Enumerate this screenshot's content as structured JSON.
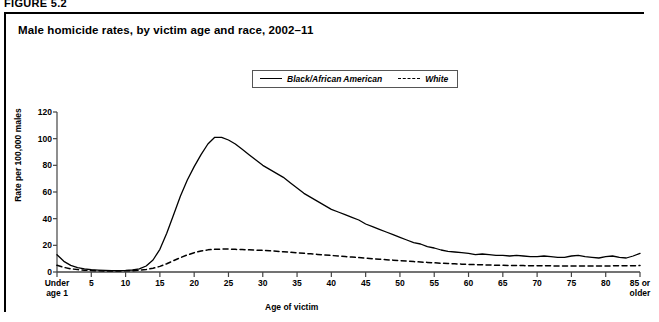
{
  "figure": {
    "label": "FIGURE 5.2",
    "title": "Male homicide rates, by victim age and race, 2002–11"
  },
  "legend": {
    "position": "top-center",
    "entries": [
      {
        "label": "Black/African American",
        "style": "solid",
        "color": "#000000"
      },
      {
        "label": "White",
        "style": "dashed",
        "color": "#000000"
      }
    ]
  },
  "axes": {
    "ylabel": "Rate per 100,000 males",
    "xlabel": "Age of victim",
    "yticks": [
      "0",
      "20",
      "40",
      "60",
      "80",
      "100",
      "120"
    ],
    "xticks": [
      "Under\nage 1",
      "5",
      "10",
      "15",
      "20",
      "25",
      "30",
      "35",
      "40",
      "45",
      "50",
      "55",
      "60",
      "65",
      "70",
      "75",
      "80",
      "85 or\nolder"
    ]
  },
  "chart_data": {
    "type": "line",
    "title": "Male homicide rates, by victim age and race, 2002–11",
    "xlabel": "Age of victim",
    "ylabel": "Rate per 100,000 males",
    "xlim": [
      0,
      85
    ],
    "ylim": [
      0,
      120
    ],
    "grid": false,
    "legend_position": "top-center",
    "x": [
      0,
      1,
      2,
      3,
      4,
      5,
      6,
      7,
      8,
      9,
      10,
      11,
      12,
      13,
      14,
      15,
      16,
      17,
      18,
      19,
      20,
      21,
      22,
      23,
      24,
      25,
      26,
      27,
      28,
      29,
      30,
      31,
      32,
      33,
      34,
      35,
      36,
      37,
      38,
      39,
      40,
      41,
      42,
      43,
      44,
      45,
      46,
      47,
      48,
      49,
      50,
      51,
      52,
      53,
      54,
      55,
      56,
      57,
      58,
      59,
      60,
      61,
      62,
      63,
      64,
      65,
      66,
      67,
      68,
      69,
      70,
      71,
      72,
      73,
      74,
      75,
      76,
      77,
      78,
      79,
      80,
      81,
      82,
      83,
      84,
      85
    ],
    "series": [
      {
        "name": "Black/African American",
        "style": "solid",
        "color": "#000000",
        "values": [
          13.0,
          8.0,
          5.0,
          3.3,
          2.3,
          1.7,
          1.4,
          1.2,
          1.1,
          1.1,
          1.2,
          1.5,
          2.3,
          4.5,
          9.0,
          17.0,
          29.0,
          43.0,
          57.0,
          69.0,
          79.0,
          88.0,
          96.0,
          101.0,
          101.0,
          99.0,
          96.0,
          92.0,
          88.0,
          84.0,
          80.0,
          77.0,
          74.0,
          71.0,
          67.0,
          63.0,
          59.0,
          56.0,
          53.0,
          50.0,
          47.0,
          45.0,
          43.0,
          41.0,
          39.0,
          36.0,
          34.0,
          32.0,
          30.0,
          28.0,
          26.0,
          24.0,
          22.0,
          21.0,
          19.0,
          18.0,
          16.5,
          15.5,
          15.0,
          14.5,
          14.0,
          13.0,
          13.5,
          13.0,
          12.5,
          12.5,
          12.0,
          12.5,
          12.0,
          11.5,
          11.5,
          12.0,
          11.5,
          11.0,
          11.0,
          12.0,
          12.5,
          11.5,
          11.0,
          10.5,
          11.5,
          12.0,
          11.0,
          10.5,
          12.0,
          14.0
        ]
      },
      {
        "name": "White",
        "style": "dashed",
        "color": "#000000",
        "values": [
          5.0,
          3.5,
          2.4,
          1.8,
          1.4,
          1.1,
          0.9,
          0.8,
          0.8,
          0.8,
          0.9,
          1.0,
          1.3,
          1.9,
          2.8,
          4.2,
          6.2,
          8.5,
          10.8,
          12.8,
          14.5,
          15.8,
          16.6,
          17.0,
          17.2,
          17.2,
          17.0,
          16.8,
          16.6,
          16.4,
          16.2,
          15.9,
          15.6,
          15.2,
          14.8,
          14.4,
          14.0,
          13.6,
          13.2,
          12.8,
          12.4,
          12.0,
          11.6,
          11.2,
          10.8,
          10.4,
          10.0,
          9.6,
          9.2,
          8.9,
          8.5,
          8.2,
          7.8,
          7.5,
          7.2,
          6.9,
          6.6,
          6.4,
          6.1,
          5.9,
          5.7,
          5.5,
          5.4,
          5.2,
          5.1,
          5.0,
          4.9,
          4.8,
          4.8,
          4.7,
          4.7,
          4.6,
          4.6,
          4.5,
          4.5,
          4.5,
          4.5,
          4.5,
          4.5,
          4.5,
          4.5,
          4.6,
          4.6,
          4.6,
          4.7,
          4.8
        ]
      }
    ]
  }
}
